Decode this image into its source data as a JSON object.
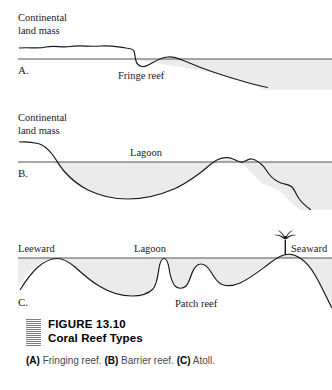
{
  "figure": {
    "number": "FIGURE  13.10",
    "title": "Coral Reef Types",
    "marker_icon": "hatched-square-icon",
    "description_parts": {
      "a_tag": "(A)",
      "a_text": " Fringing reef. ",
      "b_tag": "(B)",
      "b_text": " Barrier reef. ",
      "c_tag": "(C)",
      "c_text": " Atoll."
    }
  },
  "panels": [
    {
      "letter": "A.",
      "type": "fringing-reef",
      "labels": {
        "land": "Continental\nland mass",
        "reef": "Fringe reef"
      }
    },
    {
      "letter": "B.",
      "type": "barrier-reef",
      "labels": {
        "land": "Continental\nland mass",
        "lagoon": "Lagoon"
      }
    },
    {
      "letter": "C.",
      "type": "atoll",
      "labels": {
        "leeward": "Leeward",
        "lagoon": "Lagoon",
        "seaward": "Seaward",
        "patch": "Patch reef"
      },
      "icons": {
        "palm": "palm-tree-icon"
      }
    }
  ],
  "style": {
    "water_fill": "#ebebeb",
    "line_color": "#1a1a1a",
    "waterline_color": "#555555",
    "background": "#ffffff"
  }
}
